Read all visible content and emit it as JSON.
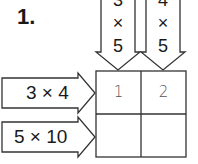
{
  "question": {
    "number": "1."
  },
  "columns": [
    {
      "top": "3",
      "op": "×",
      "bottom": "5"
    },
    {
      "top": "4",
      "op": "×",
      "bottom": "5"
    }
  ],
  "rows": [
    {
      "label": "3 × 4"
    },
    {
      "label": "5 × 10"
    }
  ],
  "grid": {
    "cells": [
      [
        "1",
        "2"
      ],
      [
        "",
        ""
      ]
    ]
  },
  "colors": {
    "stroke": "#333333",
    "text": "#1a1a1a",
    "handwriting": "#555555"
  }
}
